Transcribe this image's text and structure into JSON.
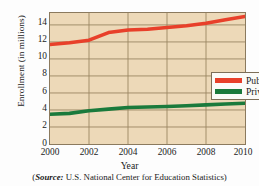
{
  "chart_data": {
    "type": "line",
    "title": "",
    "xlabel": "Year",
    "ylabel": "Enrollment (in millions)",
    "xlim": [
      2000,
      2010
    ],
    "ylim": [
      0,
      15.4
    ],
    "xticks": [
      2000,
      2002,
      2004,
      2006,
      2008,
      2010
    ],
    "yticks": [
      0,
      2,
      4,
      6,
      8,
      10,
      12,
      14
    ],
    "grid": true,
    "legend_position": "center-right",
    "x": [
      2000,
      2001,
      2002,
      2003,
      2004,
      2005,
      2006,
      2007,
      2008,
      2009,
      2010
    ],
    "series": [
      {
        "name": "Public",
        "color": "#e8402a",
        "values": [
          11.7,
          11.9,
          12.2,
          13.1,
          13.4,
          13.5,
          13.7,
          13.9,
          14.2,
          14.6,
          15.0
        ]
      },
      {
        "name": "Private",
        "color": "#1a7a3c",
        "values": [
          3.5,
          3.6,
          3.9,
          4.1,
          4.3,
          4.35,
          4.4,
          4.5,
          4.6,
          4.7,
          4.8
        ]
      }
    ],
    "source_prefix": "(",
    "source_label": "Source:",
    "source_text": " U.S. National Center for Education Statistics)"
  },
  "colors": {
    "plot_background": "#edd9b8",
    "gridline": "#9a8562",
    "frame": "#8b7a5e",
    "public": "#e8402a",
    "private": "#1a7a3c",
    "page_background": "#ffffff"
  }
}
